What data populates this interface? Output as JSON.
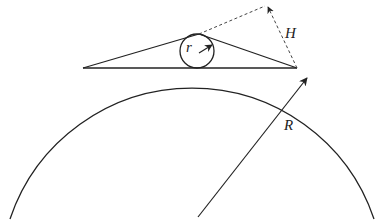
{
  "diagram": {
    "type": "geometry",
    "labels": {
      "small_radius": "r",
      "height": "H",
      "large_radius": "R"
    },
    "colors": {
      "stroke": "#222222",
      "background": "#ffffff"
    }
  }
}
